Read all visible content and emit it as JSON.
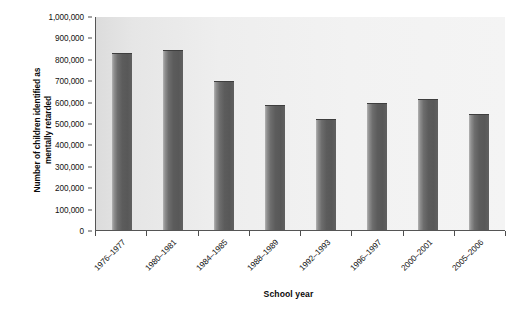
{
  "chart_data": {
    "type": "bar",
    "title": "",
    "xlabel": "School year",
    "ylabel": "Number of children identified as mentally retarded",
    "ylabel_line1": "Number of children identified as",
    "ylabel_line2": "mentally retarded",
    "categories": [
      "1976–1977",
      "1980–1981",
      "1984–1985",
      "1988–1989",
      "1992–1993",
      "1996–1997",
      "2000–2001",
      "2005–2006"
    ],
    "values": [
      825000,
      840000,
      696000,
      585000,
      518000,
      592000,
      610000,
      540000
    ],
    "ylim": [
      0,
      1000000
    ],
    "ytick_values": [
      0,
      100000,
      200000,
      300000,
      400000,
      500000,
      600000,
      700000,
      800000,
      900000,
      1000000
    ],
    "ytick_labels": [
      "0",
      "100,000",
      "200,000",
      "300,000",
      "400,000",
      "500,000",
      "600,000",
      "700,000",
      "800,000",
      "900,000",
      "1,000,000"
    ],
    "grid": false,
    "legend": false,
    "bar_color": "#5c5c5c",
    "plot_background": "#eeeeee",
    "axis_color": "#555555"
  }
}
